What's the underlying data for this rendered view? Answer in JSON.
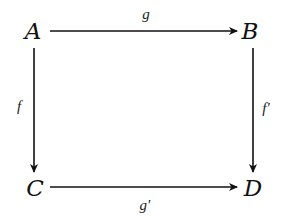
{
  "diagram": {
    "type": "commutative-square",
    "nodes": {
      "top_left": "A",
      "top_right": "B",
      "bottom_left": "C",
      "bottom_right": "D"
    },
    "arrows": {
      "top": {
        "label": "g",
        "from": "A",
        "to": "B"
      },
      "left": {
        "label": "f",
        "from": "A",
        "to": "C"
      },
      "right": {
        "label": "f′",
        "from": "B",
        "to": "D"
      },
      "bottom": {
        "label": "g′",
        "from": "C",
        "to": "D"
      }
    },
    "colors": {
      "ink": "#111111",
      "background": "#ffffff"
    }
  }
}
